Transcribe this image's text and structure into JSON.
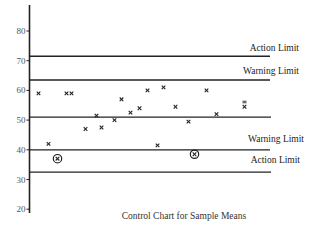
{
  "chart_data": {
    "type": "scatter",
    "title": "Control Chart for Sample Means",
    "xlabel": "",
    "ylabel": "",
    "ylim": [
      20,
      90
    ],
    "xlim": [
      0,
      29
    ],
    "yticks": [
      20,
      30,
      40,
      50,
      60,
      70,
      80
    ],
    "grid": false,
    "limits": [
      {
        "name": "upper-action-limit",
        "label": "Action Limit",
        "value": 71.5
      },
      {
        "name": "upper-warning-limit",
        "label": "Warning Limit",
        "value": 63.5
      },
      {
        "name": "center-line",
        "label": "",
        "value": 51
      },
      {
        "name": "lower-warning-limit",
        "label": "Warning Limit",
        "value": 40
      },
      {
        "name": "lower-action-limit",
        "label": "Action Limit",
        "value": 32.5
      }
    ],
    "points": [
      {
        "x": 0.9,
        "y": 59,
        "marker": "x"
      },
      {
        "x": 1.9,
        "y": 42,
        "marker": "x"
      },
      {
        "x": 2.8,
        "y": 37,
        "marker": "circled-x"
      },
      {
        "x": 3.7,
        "y": 59,
        "marker": "x"
      },
      {
        "x": 4.2,
        "y": 59,
        "marker": "x"
      },
      {
        "x": 5.6,
        "y": 47,
        "marker": "x"
      },
      {
        "x": 6.7,
        "y": 51.5,
        "marker": "x"
      },
      {
        "x": 7.2,
        "y": 47.5,
        "marker": "x"
      },
      {
        "x": 8.5,
        "y": 50,
        "marker": "x"
      },
      {
        "x": 9.2,
        "y": 57,
        "marker": "x"
      },
      {
        "x": 10.1,
        "y": 52.5,
        "marker": "x"
      },
      {
        "x": 11.0,
        "y": 54,
        "marker": "x"
      },
      {
        "x": 11.8,
        "y": 60,
        "marker": "x"
      },
      {
        "x": 12.8,
        "y": 41.5,
        "marker": "x"
      },
      {
        "x": 13.4,
        "y": 61,
        "marker": "x"
      },
      {
        "x": 14.6,
        "y": 54.5,
        "marker": "x"
      },
      {
        "x": 15.9,
        "y": 49.5,
        "marker": "x"
      },
      {
        "x": 16.5,
        "y": 38.5,
        "marker": "circled-x"
      },
      {
        "x": 17.7,
        "y": 60,
        "marker": "x"
      },
      {
        "x": 18.7,
        "y": 52,
        "marker": "x"
      },
      {
        "x": 21.5,
        "y": 54.5,
        "marker": "x-bar"
      }
    ]
  }
}
